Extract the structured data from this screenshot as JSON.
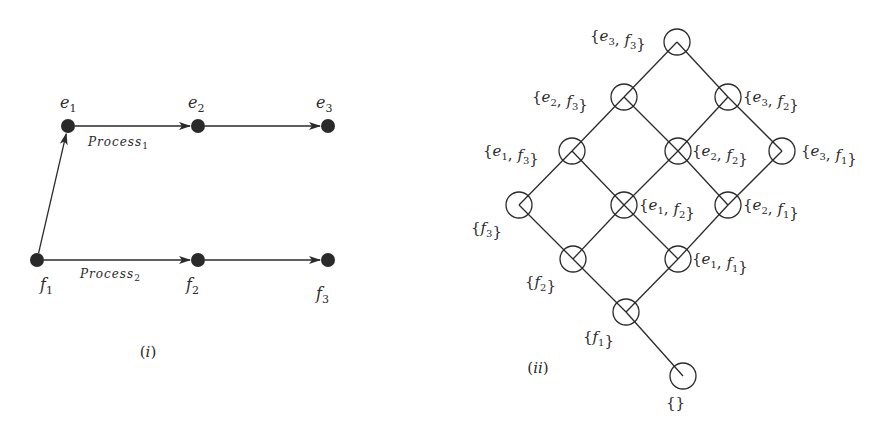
{
  "figure_i": {
    "caption": "(i)",
    "nodes": [
      {
        "id": "e1",
        "name": "e",
        "sub": "1",
        "x": 68,
        "y": 126,
        "lx": 60,
        "ly": 108
      },
      {
        "id": "e2",
        "name": "e",
        "sub": "2",
        "x": 198,
        "y": 126,
        "lx": 188,
        "ly": 108
      },
      {
        "id": "e3",
        "name": "e",
        "sub": "3",
        "x": 328,
        "y": 126,
        "lx": 316,
        "ly": 108
      },
      {
        "id": "f1",
        "name": "f",
        "sub": "1",
        "x": 37,
        "y": 260,
        "lx": 40,
        "ly": 290
      },
      {
        "id": "f2",
        "name": "f",
        "sub": "2",
        "x": 198,
        "y": 260,
        "lx": 186,
        "ly": 290
      },
      {
        "id": "f3",
        "name": "f",
        "sub": "3",
        "x": 328,
        "y": 260,
        "lx": 316,
        "ly": 299
      }
    ],
    "edges": [
      {
        "from": "e1",
        "to": "e2"
      },
      {
        "from": "e2",
        "to": "e3"
      },
      {
        "from": "f1",
        "to": "f2"
      },
      {
        "from": "f2",
        "to": "f3"
      },
      {
        "from": "f1",
        "to": "e1"
      }
    ],
    "process_labels": [
      {
        "text": "Process",
        "sub": "1",
        "x": 88,
        "y": 146
      },
      {
        "text": "Process",
        "sub": "2",
        "x": 80,
        "y": 278
      }
    ]
  },
  "figure_ii": {
    "caption": "(ii)",
    "nodes": [
      {
        "id": "e3f3",
        "label": "{e3, f3}",
        "x": 677,
        "y": 42,
        "lx": 590,
        "ly": 41,
        "anchor": "start"
      },
      {
        "id": "e2f3",
        "label": "{e2, f3}",
        "x": 624,
        "y": 97,
        "lx": 532,
        "ly": 102,
        "anchor": "start"
      },
      {
        "id": "e3f2",
        "label": "{e3, f2}",
        "x": 728,
        "y": 97,
        "lx": 743,
        "ly": 102,
        "anchor": "start"
      },
      {
        "id": "e1f3",
        "label": "{e1, f3}",
        "x": 572,
        "y": 151,
        "lx": 483,
        "ly": 156,
        "anchor": "start"
      },
      {
        "id": "e2f2",
        "label": "{e2, f2}",
        "x": 678,
        "y": 151,
        "lx": 692,
        "ly": 156,
        "anchor": "start"
      },
      {
        "id": "e3f1",
        "label": "{e3, f1}",
        "x": 782,
        "y": 151,
        "lx": 801,
        "ly": 156,
        "anchor": "start"
      },
      {
        "id": "f3",
        "label": "{f3}",
        "x": 519,
        "y": 205,
        "lx": 471,
        "ly": 233,
        "anchor": "start"
      },
      {
        "id": "e1f2",
        "label": "{e1, f2}",
        "x": 624,
        "y": 205,
        "lx": 639,
        "ly": 210,
        "anchor": "start"
      },
      {
        "id": "e2f1",
        "label": "{e2, f1}",
        "x": 728,
        "y": 205,
        "lx": 743,
        "ly": 210,
        "anchor": "start"
      },
      {
        "id": "f2",
        "label": "{f2}",
        "x": 573,
        "y": 259,
        "lx": 525,
        "ly": 287,
        "anchor": "start"
      },
      {
        "id": "e1f1",
        "label": "{e1, f1}",
        "x": 678,
        "y": 259,
        "lx": 692,
        "ly": 264,
        "anchor": "start"
      },
      {
        "id": "f1",
        "label": "{f1}",
        "x": 626,
        "y": 312,
        "lx": 583,
        "ly": 342,
        "anchor": "start"
      },
      {
        "id": "empty",
        "label": "{}",
        "x": 683,
        "y": 376,
        "lx": 666,
        "ly": 408,
        "anchor": "start"
      }
    ],
    "edges": [
      [
        "e3f3",
        "e2f3"
      ],
      [
        "e3f3",
        "e3f2"
      ],
      [
        "e2f3",
        "e1f3"
      ],
      [
        "e2f3",
        "e2f2"
      ],
      [
        "e3f2",
        "e2f2"
      ],
      [
        "e3f2",
        "e3f1"
      ],
      [
        "e1f3",
        "f3"
      ],
      [
        "e1f3",
        "e1f2"
      ],
      [
        "e2f2",
        "e1f2"
      ],
      [
        "e2f2",
        "e2f1"
      ],
      [
        "e3f1",
        "e2f1"
      ],
      [
        "f3",
        "f2"
      ],
      [
        "e1f2",
        "f2"
      ],
      [
        "e1f2",
        "e1f1"
      ],
      [
        "e2f1",
        "e1f1"
      ],
      [
        "f2",
        "f1"
      ],
      [
        "e1f1",
        "f1"
      ],
      [
        "f1",
        "empty"
      ]
    ]
  },
  "colors": {
    "ink": "#2a2a2a",
    "background": "#ffffff"
  }
}
